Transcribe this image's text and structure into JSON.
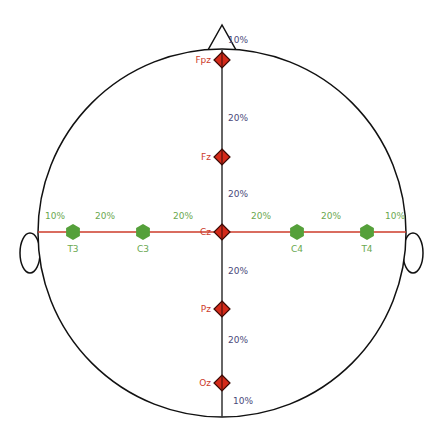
{
  "diagram": {
    "colors": {
      "outline": "#111111",
      "midline": "#333333",
      "coronal_line": "#cc3b2a",
      "midline_electrode": "#d42a1a",
      "coronal_electrode": "#55a03a",
      "midline_percent_text": "#4a4a7a",
      "coronal_percent_text": "#6aa84f",
      "midline_label_text": "#cc3b2a",
      "coronal_label_text": "#6aa84f"
    },
    "midline_electrodes": [
      {
        "label": "Fpz",
        "y": 60
      },
      {
        "label": "Fz",
        "y": 157
      },
      {
        "label": "Cz",
        "y": 232
      },
      {
        "label": "Pz",
        "y": 309
      },
      {
        "label": "Oz",
        "y": 383
      }
    ],
    "midline_percents": [
      {
        "text": "10%",
        "y": 40
      },
      {
        "text": "20%",
        "y": 118
      },
      {
        "text": "20%",
        "y": 194
      },
      {
        "text": "20%",
        "y": 271
      },
      {
        "text": "20%",
        "y": 340
      },
      {
        "text": "10%",
        "y": 401
      }
    ],
    "coronal_electrodes": [
      {
        "label": "T3",
        "x": 73
      },
      {
        "label": "C3",
        "x": 143
      },
      {
        "label": "C4",
        "x": 297
      },
      {
        "label": "T4",
        "x": 367
      }
    ],
    "coronal_percents": [
      {
        "text": "10%",
        "x": 55
      },
      {
        "text": "20%",
        "x": 105
      },
      {
        "text": "20%",
        "x": 183
      },
      {
        "text": "20%",
        "x": 261
      },
      {
        "text": "20%",
        "x": 331
      },
      {
        "text": "10%",
        "x": 395
      }
    ]
  }
}
